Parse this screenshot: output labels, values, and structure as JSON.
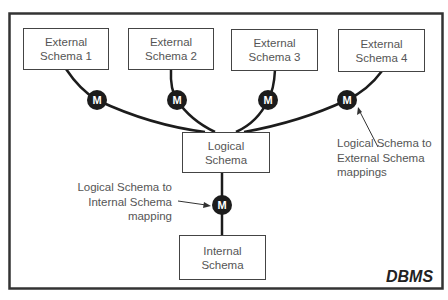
{
  "diagram": {
    "frame_label": "DBMS",
    "external_schemas": [
      {
        "line1": "External",
        "line2": "Schema 1"
      },
      {
        "line1": "External",
        "line2": "Schema 2"
      },
      {
        "line1": "External",
        "line2": "Schema 3"
      },
      {
        "line1": "External",
        "line2": "Schema 4"
      }
    ],
    "logical_schema": {
      "line1": "Logical",
      "line2": "Schema"
    },
    "internal_schema": {
      "line1": "Internal",
      "line2": "Schema"
    },
    "mapping_node_label": "M",
    "annotations": {
      "external_mappings": [
        "Logical Schema to",
        "External Schema",
        "mappings"
      ],
      "internal_mapping": [
        "Logical Schema to",
        "Internal Schema",
        "mapping"
      ]
    },
    "colors": {
      "line": "#1c1c1c",
      "text": "#555555",
      "node": "#1c1c1c",
      "frame": "#333333"
    }
  }
}
